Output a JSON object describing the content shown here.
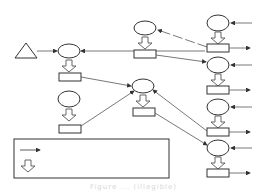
{
  "diagram": {
    "type": "flow-network",
    "colors": {
      "stroke": "#333333",
      "background": "#ffffff",
      "caption": "#d8d8d8"
    },
    "source": {
      "shape": "triangle",
      "x": 26,
      "y": 51
    },
    "nodes": [
      {
        "id": "A",
        "ellipse": [
          69,
          51
        ],
        "rect": [
          59,
          73
        ]
      },
      {
        "id": "B",
        "ellipse": [
          145,
          28
        ],
        "rect": [
          134,
          50
        ]
      },
      {
        "id": "C",
        "ellipse": [
          69,
          99
        ],
        "rect": [
          59,
          125
        ]
      },
      {
        "id": "D",
        "ellipse": [
          143,
          86
        ],
        "rect": [
          133,
          108
        ]
      },
      {
        "id": "R1",
        "ellipse": [
          218,
          23
        ],
        "rect": [
          207,
          44
        ]
      },
      {
        "id": "R2",
        "ellipse": [
          218,
          64
        ],
        "rect": [
          207,
          86
        ]
      },
      {
        "id": "R3",
        "ellipse": [
          218,
          104
        ],
        "rect": [
          207,
          130
        ]
      },
      {
        "id": "R4",
        "ellipse": [
          218,
          147
        ],
        "rect": [
          207,
          172
        ]
      }
    ],
    "legend": {
      "items": [
        {
          "icon": "solid-arrow-icon",
          "label": ""
        },
        {
          "icon": "hollow-down-arrow-icon",
          "label": ""
        }
      ]
    },
    "caption": "Figure ... (illegible)"
  }
}
